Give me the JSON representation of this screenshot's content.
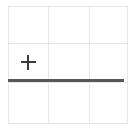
{
  "canvas": {
    "width": 132,
    "height": 130,
    "background_color": "#ffffff"
  },
  "grid": {
    "name": "table-grid",
    "rows": 3,
    "columns": 3,
    "border_color": "#e6e6e6",
    "bounds": {
      "left": 8,
      "top": 6,
      "width": 116,
      "height": 114
    },
    "column_dividers_x": [
      47,
      87
    ],
    "row_dividers_y": [
      42,
      80
    ],
    "cells": [
      [
        {
          "id": "r1c1",
          "content": ""
        },
        {
          "id": "r1c2",
          "content": ""
        },
        {
          "id": "r1c3",
          "content": ""
        }
      ],
      [
        {
          "id": "r2c1",
          "content": "",
          "icon": "plus-icon"
        },
        {
          "id": "r2c2",
          "content": ""
        },
        {
          "id": "r2c3",
          "content": ""
        }
      ],
      [
        {
          "id": "r3c1",
          "content": ""
        },
        {
          "id": "r3c2",
          "content": ""
        },
        {
          "id": "r3c3",
          "content": ""
        }
      ]
    ]
  },
  "plus_icon": {
    "name": "plus-icon",
    "color": "#3a3a3a",
    "size": 15,
    "stroke": 2,
    "center": {
      "x": 29,
      "y": 63
    },
    "cell": "r2c1",
    "label": "+"
  },
  "insertion_rule": {
    "name": "row-insertion-line",
    "color": "#585858",
    "thickness": 3,
    "y": 80,
    "x_start": 8,
    "x_end": 124,
    "between_rows": [
      2,
      3
    ]
  }
}
